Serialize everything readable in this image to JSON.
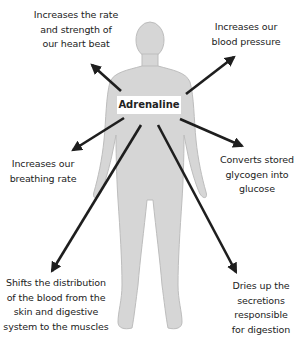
{
  "diagram": {
    "center": "Adrenaline",
    "colors": {
      "body_fill": "#d6d6d6",
      "body_stroke": "#bdbdbd",
      "arrow": "#1e1e1e",
      "background": "#ffffff"
    },
    "effects": [
      {
        "id": "heart",
        "text_lines": [
          "Increases the rate",
          "and strength of",
          "our heart beat"
        ],
        "direction": "up-left"
      },
      {
        "id": "blood-pressure",
        "text_lines": [
          "Increases our",
          "blood pressure"
        ],
        "direction": "up-right"
      },
      {
        "id": "breathing",
        "text_lines": [
          "Increases our",
          "breathing rate"
        ],
        "direction": "left"
      },
      {
        "id": "glycogen",
        "text_lines": [
          "Converts stored",
          "glycogen into",
          "glucose"
        ],
        "direction": "right"
      },
      {
        "id": "blood-distribution",
        "text_lines": [
          "Shifts the distribution",
          "of the blood from the",
          "skin and digestive",
          "system to the muscles"
        ],
        "direction": "down-left"
      },
      {
        "id": "digestion",
        "text_lines": [
          "Dries up the",
          "secretions",
          "responsible",
          "for digestion"
        ],
        "direction": "down-right"
      }
    ]
  }
}
